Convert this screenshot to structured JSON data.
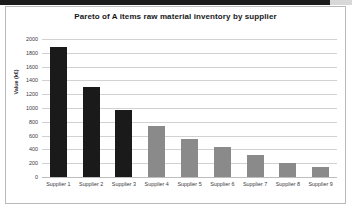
{
  "chart_data": {
    "type": "bar",
    "title": "Pareto of A items raw material inventory by supplier",
    "xlabel": "",
    "ylabel": "Value (k€)",
    "categories": [
      "Supplier 1",
      "Supplier 2",
      "Supplier 3",
      "Supplier 4",
      "Supplier 5",
      "Supplier 6",
      "Supplier 7",
      "Supplier 8",
      "Supplier 9"
    ],
    "values": [
      1890,
      1310,
      970,
      735,
      550,
      435,
      320,
      210,
      150
    ],
    "bar_colors": [
      "#1a1a1a",
      "#1a1a1a",
      "#1a1a1a",
      "#8a8a8a",
      "#8a8a8a",
      "#8a8a8a",
      "#8a8a8a",
      "#8a8a8a",
      "#8a8a8a"
    ],
    "ylim": [
      0,
      2000
    ],
    "ytick_labels": [
      "2000",
      "1800",
      "1600",
      "1400",
      "1200",
      "1000",
      "800",
      "600",
      "400",
      "200",
      "0"
    ],
    "ytick_values": [
      2000,
      1800,
      1600,
      1400,
      1200,
      1000,
      800,
      600,
      400,
      200,
      0
    ],
    "grid": true,
    "legend": false,
    "legend_position": "none",
    "series": [
      {
        "name": "Inventory value",
        "values": [
          1890,
          1310,
          970,
          735,
          550,
          435,
          320,
          210,
          150
        ]
      }
    ]
  },
  "colors": {
    "dark_bar": "#1a1a1a",
    "gray_bar": "#8a8a8a",
    "gridline": "#d2d2d2",
    "frame_border": "#b9b9b9",
    "title_text": "#17171a",
    "tick_text": "#3a3a3d",
    "top_strip": "#1c1c1c",
    "canvas": "#ffffff"
  }
}
